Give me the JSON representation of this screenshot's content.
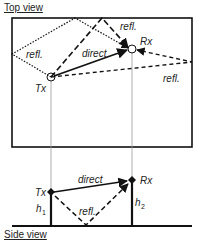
{
  "top_view": {
    "title": "Top view",
    "labels": {
      "tx": "Tx",
      "rx": "Rx",
      "direct": "direct",
      "refl_left": "refl.",
      "refl_top": "refl.",
      "refl_right": "refl."
    }
  },
  "side_view": {
    "title": "Side view",
    "labels": {
      "tx": "Tx",
      "rx": "Rx",
      "direct": "direct",
      "refl": "refl.",
      "h1_base": "h",
      "h1_sub": "1",
      "h2_base": "h",
      "h2_sub": "2"
    }
  },
  "colors": {
    "stroke": "#111111",
    "guide": "#999999"
  }
}
